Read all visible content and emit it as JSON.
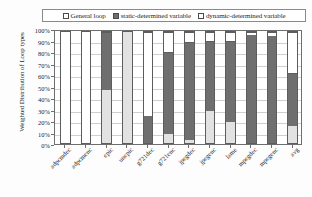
{
  "chart_data": {
    "type": "bar",
    "subtype": "stacked-100-percent",
    "title": "",
    "xlabel": "",
    "ylabel": "Weighted Distribution of Loop types",
    "ylim": [
      0,
      100
    ],
    "ytick_labels": [
      "100%",
      "90%",
      "80%",
      "70%",
      "60%",
      "50%",
      "40%",
      "30%",
      "20%",
      "10%",
      "0%"
    ],
    "ytick_values": [
      100,
      90,
      80,
      70,
      60,
      50,
      40,
      30,
      20,
      10,
      0
    ],
    "grid": true,
    "legend_position": "top",
    "categories": [
      "adpcmdec",
      "adpcmenc",
      "epic",
      "unepic",
      "g721dec",
      "g721enc",
      "jpegdec",
      "jpegenc",
      "lame",
      "mpegdec",
      "mpegenc",
      "avg"
    ],
    "series": [
      {
        "name": "General loop",
        "color": "#e2e2e2",
        "values": [
          0,
          0,
          48,
          100,
          0,
          8,
          3,
          29,
          19,
          0,
          0,
          15
        ]
      },
      {
        "name": "static-determined variable",
        "color": "#6f6f6f",
        "values": [
          0,
          0,
          52,
          0,
          24,
          74,
          88,
          63,
          73,
          97,
          96,
          48
        ]
      },
      {
        "name": "dynamic-determined variable",
        "color": "#ffffff",
        "values": [
          100,
          100,
          0,
          0,
          76,
          18,
          9,
          8,
          8,
          3,
          4,
          37
        ]
      }
    ]
  },
  "legend": {
    "entries": [
      {
        "label": "General loop",
        "swatch": "#ffffff"
      },
      {
        "label": "static-determined variable",
        "swatch": "#6f6f6f"
      },
      {
        "label": "dynamic-determined variable",
        "swatch": "#ffffff"
      }
    ]
  },
  "axes": {
    "y_title": "Weighted Distribution of Loop types"
  }
}
